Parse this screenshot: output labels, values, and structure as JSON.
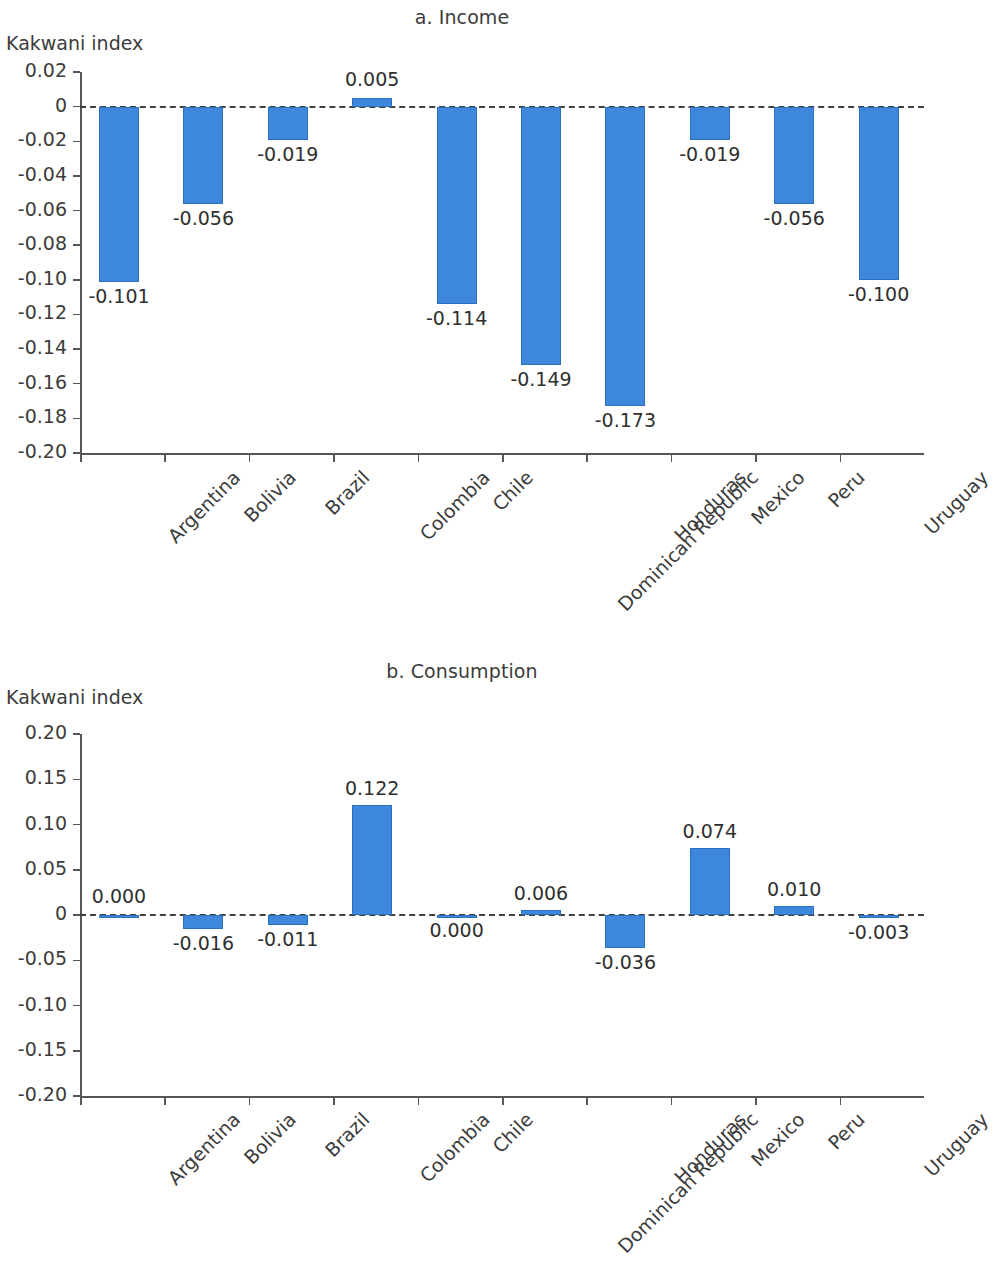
{
  "figure": {
    "axis_title": "Kakwani index"
  },
  "panels": [
    {
      "title": "a. Income",
      "ylabel": "Kakwani index"
    },
    {
      "title": "b. Consumption",
      "ylabel": "Kakwani index"
    }
  ],
  "chart_data": [
    {
      "type": "bar",
      "title": "a. Income",
      "xlabel": "",
      "ylabel": "Kakwani index",
      "ylim": [
        -0.2,
        0.02
      ],
      "yticks": [
        0.02,
        0,
        -0.02,
        -0.04,
        -0.06,
        -0.08,
        -0.1,
        -0.12,
        -0.14,
        -0.16,
        -0.18,
        -0.2
      ],
      "ytick_labels": [
        "0.02",
        "0",
        "-0.02",
        "-0.04",
        "-0.06",
        "-0.08",
        "-0.10",
        "-0.12",
        "-0.14",
        "-0.16",
        "-0.18",
        "-0.20"
      ],
      "categories": [
        "Argentina",
        "Bolivia",
        "Brazil",
        "Colombia",
        "Chile",
        "Dominican Republic",
        "Honduras",
        "Mexico",
        "Peru",
        "Uruguay"
      ],
      "values": [
        -0.101,
        -0.056,
        -0.019,
        0.005,
        -0.114,
        -0.149,
        -0.173,
        -0.019,
        -0.056,
        -0.1
      ],
      "data_labels": [
        "-0.101",
        "-0.056",
        "-0.019",
        "0.005",
        "-0.114",
        "-0.149",
        "-0.173",
        "-0.019",
        "-0.056",
        "-0.100"
      ],
      "bar_color": "#3d87dd",
      "grid": false,
      "legend": "none",
      "zero_reference_line": true
    },
    {
      "type": "bar",
      "title": "b. Consumption",
      "xlabel": "",
      "ylabel": "Kakwani index",
      "ylim": [
        -0.2,
        0.2
      ],
      "yticks": [
        0.2,
        0.15,
        0.1,
        0.05,
        0,
        -0.05,
        -0.1,
        -0.15,
        -0.2
      ],
      "ytick_labels": [
        "0.20",
        "0.15",
        "0.10",
        "0.05",
        "0",
        "-0.05",
        "-0.10",
        "-0.15",
        "-0.20"
      ],
      "categories": [
        "Argentina",
        "Bolivia",
        "Brazil",
        "Colombia",
        "Chile",
        "Dominican Republic",
        "Honduras",
        "Mexico",
        "Peru",
        "Uruguay"
      ],
      "values": [
        0.0,
        -0.016,
        -0.011,
        0.122,
        0.0,
        0.006,
        -0.036,
        0.074,
        0.01,
        -0.003
      ],
      "data_labels": [
        "0.000",
        "-0.016",
        "-0.011",
        "0.122",
        "0.000",
        "0.006",
        "-0.036",
        "0.074",
        "0.010",
        "-0.003"
      ],
      "bar_color": "#3d87dd",
      "grid": false,
      "legend": "none",
      "zero_reference_line": true
    }
  ]
}
